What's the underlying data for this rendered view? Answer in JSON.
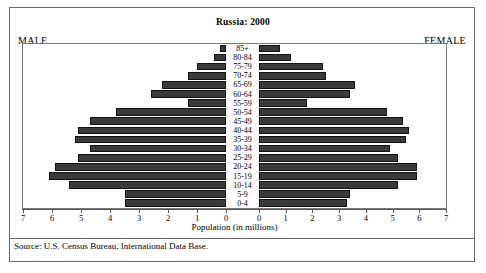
{
  "title": "Russia: 2000",
  "labels": {
    "male": "MALE",
    "female": "FEMALE",
    "xaxis": "Population (in millions)",
    "source": "Source: U.S. Census Bureau, International Data Base."
  },
  "axis": {
    "tick_labels_left": [
      "7",
      "6",
      "5",
      "4",
      "3",
      "2",
      "1",
      "0"
    ],
    "tick_labels_right": [
      "0",
      "1",
      "2",
      "3",
      "4",
      "5",
      "6",
      "7"
    ],
    "max": 7,
    "min": 0
  },
  "colors": {
    "bar": "#3a3a3a",
    "bar_border": "#111111",
    "frame": "#6a6a6a",
    "plot_border": "#7a7a7a",
    "text": "#000000"
  },
  "chart_data": {
    "type": "bar",
    "subtype": "population-pyramid",
    "title": "Russia: 2000",
    "xlabel": "Population (in millions)",
    "ylabel": "",
    "xlim": [
      0,
      7
    ],
    "grid": false,
    "legend": "none",
    "categories": [
      "85+",
      "80-84",
      "75-79",
      "70-74",
      "65-69",
      "60-64",
      "55-59",
      "50-54",
      "45-49",
      "40-44",
      "35-39",
      "30-34",
      "25-29",
      "20-24",
      "15-19",
      "10-14",
      "5-9",
      "0-4"
    ],
    "series": [
      {
        "name": "MALE",
        "side": "left",
        "values": [
          0.2,
          0.4,
          1.0,
          1.3,
          2.2,
          2.6,
          1.3,
          3.8,
          4.7,
          5.1,
          5.2,
          4.7,
          5.1,
          5.9,
          6.1,
          5.4,
          3.5,
          3.5
        ]
      },
      {
        "name": "FEMALE",
        "side": "right",
        "values": [
          0.8,
          1.2,
          2.4,
          2.5,
          3.6,
          3.4,
          1.8,
          4.8,
          5.4,
          5.6,
          5.5,
          4.9,
          5.2,
          5.9,
          5.9,
          5.2,
          3.4,
          3.3
        ]
      }
    ]
  }
}
